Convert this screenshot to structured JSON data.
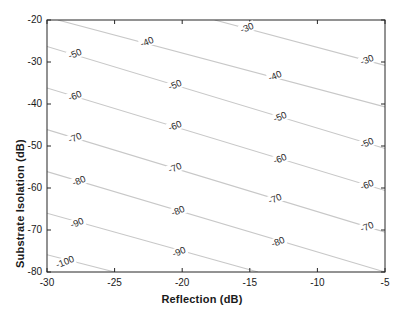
{
  "figure": {
    "background_color": "#ffffff",
    "axes_color": "#262626",
    "contour_color": "#c8c8c8",
    "text_color": "#1a1a1a"
  },
  "chart_data": {
    "type": "line",
    "subtype": "contour",
    "title": "",
    "xlabel": "Reflection (dB)",
    "ylabel": "Substrate Isolation (dB)",
    "xlim": [
      -30,
      -5
    ],
    "ylim": [
      -80,
      -20
    ],
    "y_axis_inverted": false,
    "grid": false,
    "legend": null,
    "xticks": [
      -30,
      -25,
      -20,
      -15,
      -10,
      -5
    ],
    "xticklabels": [
      "-30",
      "-25",
      "-20",
      "-15",
      "-10",
      "-5"
    ],
    "yticks": [
      -80,
      -70,
      -60,
      -50,
      -40,
      -30,
      -20
    ],
    "yticklabels": [
      "-80",
      "-70",
      "-60",
      "-50",
      "-40",
      "-30",
      "-20"
    ],
    "levels": [
      -30,
      -40,
      -50,
      -60,
      -70,
      -80,
      -90,
      -100
    ],
    "contours": [
      {
        "level": -30,
        "label": "-30",
        "points": [
          [
            -17.6,
            -20.0
          ],
          [
            -5.0,
            -30.8
          ]
        ],
        "labels": [
          {
            "text": "-30",
            "x": -15.2,
            "y": -21.9,
            "angle": -22
          },
          {
            "text": "-30",
            "x": -6.3,
            "y": -29.6,
            "angle": -22
          }
        ]
      },
      {
        "level": -40,
        "label": "-40",
        "points": [
          [
            -29.2,
            -20.0
          ],
          [
            -5.0,
            -40.7
          ]
        ],
        "labels": [
          {
            "text": "-40",
            "x": -22.6,
            "y": -25.2,
            "angle": -22
          },
          {
            "text": "-40",
            "x": -13.1,
            "y": -33.3,
            "angle": -22
          }
        ]
      },
      {
        "level": -50,
        "label": "-50",
        "points": [
          [
            -30.0,
            -26.3
          ],
          [
            -5.0,
            -50.6
          ]
        ],
        "labels": [
          {
            "text": "-50",
            "x": -27.9,
            "y": -28.1,
            "angle": -22
          },
          {
            "text": "-50",
            "x": -20.5,
            "y": -35.4,
            "angle": -22
          },
          {
            "text": "-50",
            "x": -12.8,
            "y": -43.2,
            "angle": -22
          },
          {
            "text": "-50",
            "x": -6.3,
            "y": -49.4,
            "angle": -22
          }
        ]
      },
      {
        "level": -60,
        "label": "-60",
        "points": [
          [
            -30.0,
            -36.2
          ],
          [
            -5.0,
            -60.6
          ]
        ],
        "labels": [
          {
            "text": "-60",
            "x": -27.9,
            "y": -38.2,
            "angle": -22
          },
          {
            "text": "-60",
            "x": -20.5,
            "y": -45.3,
            "angle": -22
          },
          {
            "text": "-60",
            "x": -12.8,
            "y": -53.2,
            "angle": -22
          },
          {
            "text": "-60",
            "x": -6.3,
            "y": -59.4,
            "angle": -22
          }
        ]
      },
      {
        "level": -70,
        "label": "-70",
        "points": [
          [
            -30.0,
            -46.1
          ],
          [
            -5.0,
            -70.5
          ]
        ],
        "labels": [
          {
            "text": "-70",
            "x": -27.9,
            "y": -48.1,
            "angle": -22
          },
          {
            "text": "-70",
            "x": -20.5,
            "y": -55.3,
            "angle": -22
          },
          {
            "text": "-70",
            "x": -13.1,
            "y": -62.6,
            "angle": -22
          },
          {
            "text": "-70",
            "x": -6.3,
            "y": -69.3,
            "angle": -22
          }
        ]
      },
      {
        "level": -80,
        "label": "-80",
        "points": [
          [
            -30.0,
            -56.1
          ],
          [
            -5.0,
            -80.0
          ]
        ],
        "labels": [
          {
            "text": "-80",
            "x": -27.6,
            "y": -58.4,
            "angle": -22
          },
          {
            "text": "-80",
            "x": -20.3,
            "y": -65.4,
            "angle": -22
          },
          {
            "text": "-80",
            "x": -12.9,
            "y": -72.8,
            "angle": -22
          }
        ]
      },
      {
        "level": -90,
        "label": "-90",
        "points": [
          [
            -30.0,
            -66.0
          ],
          [
            -14.4,
            -80.0
          ]
        ],
        "labels": [
          {
            "text": "-90",
            "x": -27.8,
            "y": -68.3,
            "angle": -22
          },
          {
            "text": "-90",
            "x": -20.2,
            "y": -75.3,
            "angle": -22
          }
        ]
      },
      {
        "level": -100,
        "label": "-100",
        "points": [
          [
            -30.0,
            -75.9
          ],
          [
            -25.0,
            -80.0
          ]
        ],
        "labels": [
          {
            "text": "-100",
            "x": -28.7,
            "y": -77.6,
            "angle": -22
          }
        ]
      }
    ]
  }
}
